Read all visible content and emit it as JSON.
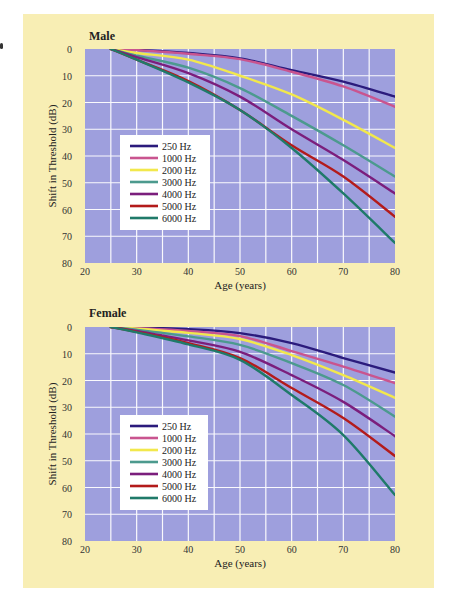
{
  "figure": {
    "background": "#f8eeb4",
    "plot_background": "#9e9fdd",
    "grid_color": "#ffffff"
  },
  "chart_data": [
    {
      "type": "line",
      "title": "Male",
      "xlabel": "Age (years)",
      "ylabel": "Shift in Threshold (dB)",
      "xlim": [
        20,
        80
      ],
      "ylim": [
        0,
        80
      ],
      "y_inverted": true,
      "x_ticks": [
        20,
        30,
        40,
        50,
        60,
        70,
        80
      ],
      "y_ticks": [
        0,
        10,
        20,
        30,
        40,
        50,
        60,
        70,
        80
      ],
      "grid": true,
      "legend_position": "inside-left",
      "x": [
        25,
        30,
        40,
        50,
        60,
        70,
        80
      ],
      "series": [
        {
          "name": "250 Hz",
          "color": "#2b1b7c",
          "values": [
            0,
            0.3,
            1.5,
            3.5,
            7.9,
            12.2,
            17.8
          ]
        },
        {
          "name": "1000 Hz",
          "color": "#c9548f",
          "values": [
            0,
            0.4,
            1.8,
            3.8,
            8.5,
            14,
            21.6
          ]
        },
        {
          "name": "2000 Hz",
          "color": "#f2e84c",
          "values": [
            0,
            1.5,
            4,
            10,
            17,
            26.5,
            37
          ]
        },
        {
          "name": "3000 Hz",
          "color": "#4c9a8e",
          "values": [
            0,
            2.5,
            7,
            14.6,
            25,
            36,
            47.7
          ]
        },
        {
          "name": "4000 Hz",
          "color": "#7b1e7c",
          "values": [
            0,
            3,
            9,
            17.8,
            30,
            41.5,
            54
          ]
        },
        {
          "name": "5000 Hz",
          "color": "#b31b1b",
          "values": [
            0,
            4,
            12,
            22.8,
            36,
            47.7,
            62.7
          ]
        },
        {
          "name": "6000 Hz",
          "color": "#1f7a69",
          "values": [
            0,
            4,
            12.5,
            22.8,
            37,
            54,
            72.5
          ]
        }
      ]
    },
    {
      "type": "line",
      "title": "Female",
      "xlabel": "Age (years)",
      "ylabel": "Shift in Threshold (dB)",
      "xlim": [
        20,
        80
      ],
      "ylim": [
        0,
        80
      ],
      "y_inverted": true,
      "x_ticks": [
        20,
        30,
        40,
        50,
        60,
        70,
        80
      ],
      "y_ticks": [
        0,
        10,
        20,
        30,
        40,
        50,
        60,
        70,
        80
      ],
      "grid": true,
      "legend_position": "inside-left",
      "x": [
        25,
        30,
        40,
        50,
        60,
        70,
        80
      ],
      "series": [
        {
          "name": "250 Hz",
          "color": "#2b1b7c",
          "values": [
            0,
            0.2,
            0.8,
            2.3,
            6,
            11.6,
            17
          ]
        },
        {
          "name": "1000 Hz",
          "color": "#c9548f",
          "values": [
            0,
            0.4,
            1.5,
            3.4,
            9,
            14.8,
            21
          ]
        },
        {
          "name": "2000 Hz",
          "color": "#f2e84c",
          "values": [
            0,
            0.6,
            2.2,
            4.5,
            10.5,
            18,
            26.5
          ]
        },
        {
          "name": "3000 Hz",
          "color": "#4c9a8e",
          "values": [
            0,
            1,
            3.5,
            6.7,
            13.5,
            21.7,
            33.5
          ]
        },
        {
          "name": "4000 Hz",
          "color": "#7b1e7c",
          "values": [
            0,
            1.5,
            5,
            9.3,
            18,
            28,
            40.8
          ]
        },
        {
          "name": "5000 Hz",
          "color": "#b31b1b",
          "values": [
            0,
            1.8,
            6,
            11.6,
            22.8,
            34,
            48.2
          ]
        },
        {
          "name": "6000 Hz",
          "color": "#1f7a69",
          "values": [
            0,
            2,
            6.5,
            12.3,
            25.4,
            40.4,
            62.8
          ]
        }
      ]
    }
  ]
}
